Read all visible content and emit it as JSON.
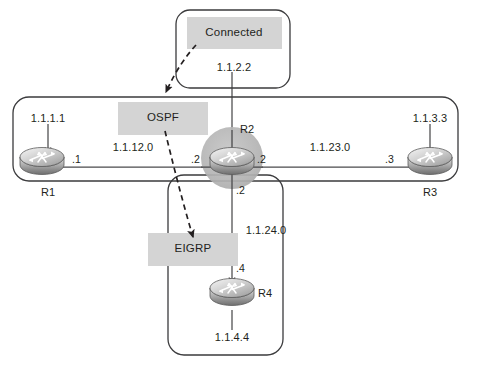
{
  "diagram": {
    "type": "network-topology",
    "title": "",
    "colors": {
      "stroke": "#3b3b3d",
      "text": "#231f20",
      "label_band": "#d4d4d4",
      "node_highlight": "#b3b3b3",
      "router_body_light": "#e8e8e8",
      "router_body_dark": "#8d8d8d",
      "link": "#4a4a4c"
    },
    "domains": [
      {
        "id": "connected",
        "label": "Connected",
        "shape": "rounded-rect",
        "address": "1.1.2.2"
      },
      {
        "id": "ospf",
        "label": "OSPF",
        "shape": "rounded-rect"
      },
      {
        "id": "eigrp",
        "label": "EIGRP",
        "shape": "rounded-rect"
      }
    ],
    "routers": [
      {
        "id": "r1",
        "name": "R1",
        "loopback": "1.1.1.1",
        "interface": ".1"
      },
      {
        "id": "r2",
        "name": "R2",
        "loopback": "1.1.2.2",
        "highlighted": true
      },
      {
        "id": "r3",
        "name": "R3",
        "loopback": "1.1.3.3",
        "interface": ".3"
      },
      {
        "id": "r4",
        "name": "R4",
        "loopback": "1.1.4.4",
        "interface": ".4"
      }
    ],
    "r2_interfaces": {
      "west": ".2",
      "east": ".2",
      "south": ".2"
    },
    "links": [
      {
        "id": "r1-r2",
        "subnet": "1.1.12.0",
        "from": "r1",
        "to": "r2"
      },
      {
        "id": "r2-r3",
        "subnet": "1.1.23.0",
        "from": "r2",
        "to": "r3"
      },
      {
        "id": "r2-r4",
        "subnet": "1.1.24.0",
        "from": "r2",
        "to": "r4"
      }
    ],
    "annotations": [
      {
        "id": "arrow-connected-to-ospf",
        "style": "dashed-arrow"
      },
      {
        "id": "arrow-ospf-to-eigrp",
        "style": "dashed-arrow"
      }
    ]
  }
}
